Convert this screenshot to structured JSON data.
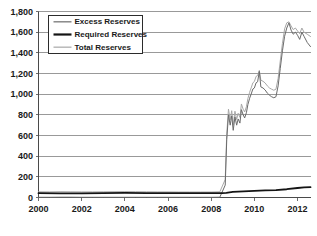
{
  "chart_data": {
    "type": "line",
    "title": "",
    "subtitle": "",
    "xlabel": "",
    "ylabel": "",
    "xlim": [
      2000.0,
      2012.6
    ],
    "ylim": [
      0,
      1800
    ],
    "grid": true,
    "legend_position": "top-left",
    "y_ticks": [
      0,
      200,
      400,
      600,
      800,
      1000,
      1200,
      1400,
      1600,
      1800
    ],
    "y_tick_labels": [
      "0",
      "200",
      "400",
      "600",
      "800",
      "1,000",
      "1,200",
      "1,400",
      "1,600",
      "1,800"
    ],
    "x_ticks": [
      2000,
      2002,
      2004,
      2006,
      2008,
      2010,
      2012
    ],
    "x_tick_labels": [
      "2000",
      "2002",
      "2004",
      "2006",
      "2008",
      "2010",
      "2012"
    ],
    "series": [
      {
        "name": "Excess Reserves",
        "color": "#6b6b6b",
        "width": 1.0,
        "x": [
          2000.0,
          2000.5,
          2001.0,
          2001.5,
          2002.0,
          2002.5,
          2003.0,
          2003.5,
          2004.0,
          2004.5,
          2005.0,
          2005.5,
          2006.0,
          2006.5,
          2007.0,
          2007.5,
          2008.0,
          2008.4,
          2008.65,
          2008.72,
          2008.8,
          2008.88,
          2008.95,
          2009.02,
          2009.1,
          2009.18,
          2009.25,
          2009.33,
          2009.4,
          2009.48,
          2009.55,
          2009.63,
          2009.7,
          2009.78,
          2009.85,
          2009.93,
          2010.0,
          2010.08,
          2010.15,
          2010.23,
          2010.3,
          2010.4,
          2010.5,
          2010.6,
          2010.7,
          2010.8,
          2010.9,
          2011.0,
          2011.1,
          2011.2,
          2011.3,
          2011.4,
          2011.5,
          2011.6,
          2011.7,
          2011.8,
          2011.9,
          2012.0,
          2012.1,
          2012.2,
          2012.3,
          2012.45,
          2012.6
        ],
        "y": [
          2,
          2,
          3,
          3,
          2,
          2,
          2,
          2,
          2,
          2,
          2,
          2,
          2,
          2,
          2,
          2,
          2,
          3,
          120,
          560,
          800,
          700,
          790,
          650,
          780,
          700,
          760,
          720,
          850,
          800,
          770,
          820,
          900,
          960,
          1000,
          1050,
          1060,
          1110,
          1120,
          1220,
          1070,
          1060,
          1040,
          1010,
          990,
          975,
          965,
          975,
          1080,
          1250,
          1420,
          1560,
          1640,
          1690,
          1620,
          1580,
          1600,
          1570,
          1530,
          1600,
          1560,
          1500,
          1460
        ],
        "note": "Excess reserves near zero until late 2008, then spike to ~800, oscillate, peak ~1,690 in 2011, decline to ~1,460 by late 2012"
      },
      {
        "name": "Required Reserves",
        "color": "#141414",
        "width": 1.8,
        "x": [
          2000.0,
          2001.0,
          2002.0,
          2003.0,
          2004.0,
          2005.0,
          2006.0,
          2007.0,
          2008.0,
          2008.5,
          2008.7,
          2009.0,
          2009.5,
          2010.0,
          2010.5,
          2011.0,
          2011.5,
          2012.0,
          2012.3,
          2012.6
        ],
        "y": [
          42,
          40,
          40,
          42,
          44,
          43,
          42,
          42,
          42,
          42,
          45,
          55,
          60,
          65,
          68,
          72,
          80,
          92,
          98,
          100
        ],
        "note": "Required reserves flat near 40-45 until 2008, then gradual rise to ~100 by late 2012"
      },
      {
        "name": "Total Reserves",
        "color": "#a8a8a8",
        "width": 1.0,
        "x": [
          2000.0,
          2000.5,
          2001.0,
          2001.5,
          2002.0,
          2002.5,
          2003.0,
          2003.5,
          2004.0,
          2004.5,
          2005.0,
          2005.5,
          2006.0,
          2006.5,
          2007.0,
          2007.5,
          2008.0,
          2008.4,
          2008.65,
          2008.72,
          2008.8,
          2008.88,
          2008.95,
          2009.02,
          2009.1,
          2009.18,
          2009.25,
          2009.33,
          2009.4,
          2009.48,
          2009.55,
          2009.63,
          2009.7,
          2009.78,
          2009.85,
          2009.93,
          2010.0,
          2010.08,
          2010.15,
          2010.23,
          2010.3,
          2010.4,
          2010.5,
          2010.6,
          2010.7,
          2010.8,
          2010.9,
          2011.0,
          2011.1,
          2011.2,
          2011.3,
          2011.4,
          2011.5,
          2011.6,
          2011.7,
          2011.8,
          2011.9,
          2012.0,
          2012.1,
          2012.2,
          2012.3,
          2012.45,
          2012.6
        ],
        "y": [
          55,
          54,
          56,
          55,
          54,
          54,
          55,
          56,
          57,
          56,
          55,
          54,
          54,
          53,
          53,
          53,
          53,
          55,
          175,
          615,
          855,
          752,
          840,
          700,
          835,
          755,
          815,
          775,
          905,
          855,
          828,
          878,
          958,
          1018,
          1060,
          1110,
          1122,
          1172,
          1180,
          1230,
          1135,
          1125,
          1108,
          1080,
          1060,
          1048,
          1038,
          1048,
          1152,
          1322,
          1492,
          1632,
          1690,
          1700,
          1660,
          1625,
          1640,
          1612,
          1585,
          1640,
          1600,
          1580,
          1558
        ],
        "note": "Total reserves = excess + required; tracks slightly above excess reserves line throughout"
      }
    ]
  },
  "legend": {
    "items": [
      {
        "label": "Excess Reserves",
        "color": "#6b6b6b",
        "width": 1.2
      },
      {
        "label": "Required Reserves",
        "color": "#141414",
        "width": 2.2
      },
      {
        "label": "Total Reserves",
        "color": "#a8a8a8",
        "width": 1.2
      }
    ]
  }
}
